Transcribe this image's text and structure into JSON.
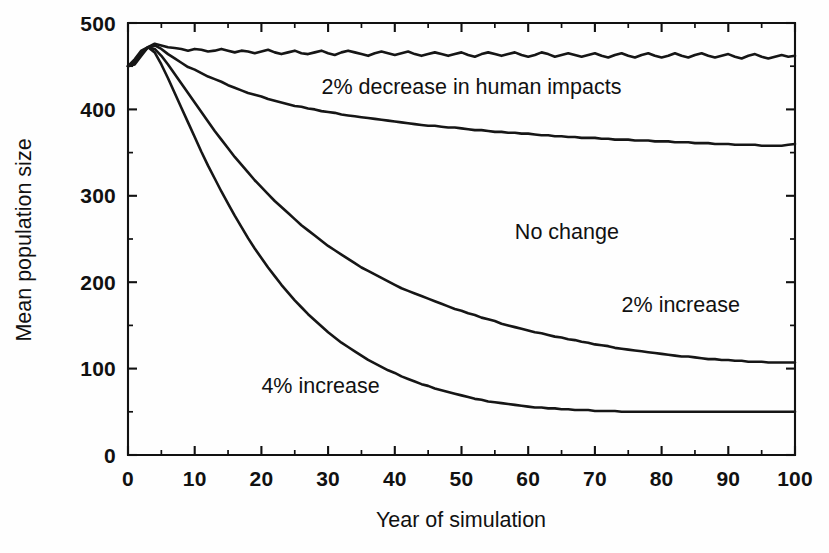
{
  "chart_data": {
    "type": "line",
    "title": "",
    "xlabel": "Year of simulation",
    "ylabel": "Mean population size",
    "xlim": [
      0,
      100
    ],
    "ylim": [
      0,
      500
    ],
    "grid": false,
    "legend_position": "inline-annotations",
    "x_ticks": [
      0,
      10,
      20,
      30,
      40,
      50,
      60,
      70,
      80,
      90,
      100
    ],
    "x_tick_labels": [
      "0",
      "10",
      "20",
      "30",
      "40",
      "50",
      "60",
      "70",
      "80",
      "90",
      "100"
    ],
    "x_minor_ticks": [
      5,
      15,
      25,
      35,
      45,
      55,
      65,
      75,
      85,
      95
    ],
    "y_ticks": [
      0,
      100,
      200,
      300,
      400,
      500
    ],
    "y_tick_labels": [
      "0",
      "100",
      "200",
      "300",
      "400",
      "500"
    ],
    "y_minor_ticks": [
      50,
      150,
      250,
      350,
      450
    ],
    "x": [
      0,
      1,
      2,
      3,
      4,
      5,
      6,
      7,
      8,
      9,
      10,
      11,
      12,
      13,
      14,
      15,
      16,
      17,
      18,
      19,
      20,
      21,
      22,
      23,
      24,
      25,
      26,
      27,
      28,
      29,
      30,
      31,
      32,
      33,
      34,
      35,
      36,
      37,
      38,
      39,
      40,
      41,
      42,
      43,
      44,
      45,
      46,
      47,
      48,
      49,
      50,
      51,
      52,
      53,
      54,
      55,
      56,
      57,
      58,
      59,
      60,
      61,
      62,
      63,
      64,
      65,
      66,
      67,
      68,
      69,
      70,
      71,
      72,
      73,
      74,
      75,
      76,
      77,
      78,
      79,
      80,
      81,
      82,
      83,
      84,
      85,
      86,
      87,
      88,
      89,
      90,
      91,
      92,
      93,
      94,
      95,
      96,
      97,
      98,
      99,
      100
    ],
    "series": [
      {
        "name": "2% decrease in human impacts",
        "label": "2% decrease in human impacts",
        "color": "#161616",
        "annotation": {
          "x": 29,
          "y": 418,
          "text": "2% decrease in human impacts"
        },
        "values": [
          450,
          452,
          462,
          472,
          476,
          474,
          472,
          471,
          470,
          468,
          470,
          469,
          467,
          468,
          470,
          468,
          466,
          468,
          467,
          465,
          467,
          469,
          466,
          464,
          466,
          468,
          465,
          464,
          466,
          468,
          465,
          463,
          466,
          468,
          466,
          464,
          462,
          465,
          467,
          465,
          463,
          465,
          467,
          464,
          462,
          464,
          466,
          464,
          462,
          464,
          466,
          463,
          461,
          464,
          466,
          464,
          462,
          464,
          466,
          463,
          461,
          463,
          466,
          464,
          461,
          463,
          465,
          463,
          461,
          463,
          465,
          462,
          460,
          463,
          465,
          462,
          460,
          463,
          465,
          462,
          460,
          462,
          465,
          462,
          460,
          463,
          465,
          462,
          460,
          462,
          464,
          461,
          459,
          462,
          464,
          461,
          459,
          461,
          463,
          461,
          462
        ]
      },
      {
        "name": "No change",
        "label": "No change",
        "color": "#161616",
        "annotation": {
          "x": 58,
          "y": 250,
          "text": "No change"
        },
        "values": [
          450,
          454,
          464,
          472,
          474,
          470,
          464,
          459,
          454,
          449,
          446,
          442,
          438,
          435,
          432,
          428,
          425,
          422,
          419,
          417,
          415,
          412,
          410,
          408,
          406,
          404,
          403,
          401,
          400,
          398,
          397,
          396,
          394,
          393,
          392,
          391,
          390,
          389,
          388,
          387,
          386,
          385,
          384,
          383,
          382,
          381,
          381,
          380,
          379,
          379,
          378,
          377,
          376,
          376,
          375,
          374,
          374,
          373,
          373,
          372,
          372,
          371,
          370,
          370,
          369,
          369,
          368,
          368,
          367,
          367,
          367,
          366,
          366,
          365,
          365,
          365,
          364,
          364,
          364,
          363,
          363,
          363,
          362,
          362,
          362,
          361,
          361,
          361,
          360,
          360,
          360,
          359,
          359,
          359,
          359,
          358,
          358,
          358,
          358,
          359,
          360
        ]
      },
      {
        "name": "2% increase",
        "label": "2% increase",
        "color": "#161616",
        "annotation": {
          "x": 74,
          "y": 165,
          "text": "2% increase"
        },
        "values": [
          450,
          456,
          466,
          472,
          470,
          462,
          452,
          441,
          430,
          419,
          408,
          397,
          386,
          375,
          365,
          355,
          345,
          336,
          327,
          318,
          310,
          302,
          294,
          287,
          280,
          273,
          266,
          260,
          254,
          248,
          242,
          237,
          232,
          227,
          222,
          217,
          213,
          209,
          205,
          201,
          197,
          193,
          190,
          187,
          184,
          181,
          178,
          175,
          172,
          169,
          167,
          164,
          162,
          159,
          157,
          155,
          152,
          150,
          148,
          146,
          144,
          142,
          141,
          139,
          137,
          136,
          134,
          133,
          131,
          130,
          128,
          127,
          126,
          124,
          123,
          122,
          121,
          120,
          119,
          118,
          117,
          116,
          115,
          114,
          114,
          113,
          112,
          111,
          111,
          110,
          110,
          109,
          109,
          108,
          108,
          108,
          107,
          107,
          107,
          107,
          107
        ]
      },
      {
        "name": "4% increase",
        "label": "4% increase",
        "color": "#161616",
        "annotation": {
          "x": 20,
          "y": 72,
          "text": "4% increase"
        },
        "values": [
          450,
          458,
          468,
          472,
          466,
          452,
          436,
          419,
          402,
          385,
          368,
          351,
          335,
          320,
          305,
          291,
          277,
          264,
          251,
          239,
          228,
          217,
          207,
          197,
          188,
          179,
          171,
          163,
          156,
          149,
          142,
          136,
          130,
          125,
          120,
          115,
          110,
          106,
          102,
          98,
          95,
          91,
          88,
          85,
          82,
          80,
          77,
          75,
          73,
          71,
          69,
          67,
          65,
          64,
          62,
          61,
          60,
          59,
          58,
          57,
          56,
          55,
          55,
          54,
          54,
          53,
          53,
          52,
          52,
          52,
          51,
          51,
          51,
          51,
          50,
          50,
          50,
          50,
          50,
          50,
          50,
          50,
          50,
          50,
          50,
          50,
          50,
          50,
          50,
          50,
          50,
          50,
          50,
          50,
          50,
          50,
          50,
          50,
          50,
          50,
          50
        ]
      }
    ]
  },
  "axes": {
    "x_title": "Year of simulation",
    "y_title": "Mean population size"
  }
}
